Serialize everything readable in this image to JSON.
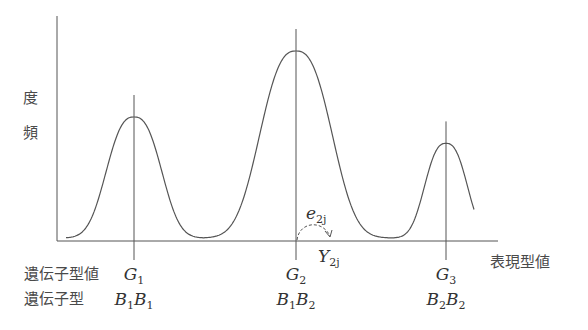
{
  "diagram": {
    "y_axis_label": "頻 度",
    "x_axis_label": "表現型値",
    "row_labels": {
      "genotypic_value": "遺伝子型値",
      "genotype": "遺伝子型"
    },
    "groups": [
      {
        "value_symbol": "G",
        "value_sub": "1",
        "genotype": [
          {
            "s": "B",
            "sub": "1"
          },
          {
            "s": "B",
            "sub": "1"
          }
        ],
        "relative_height": 0.55
      },
      {
        "value_symbol": "G",
        "value_sub": "2",
        "genotype": [
          {
            "s": "B",
            "sub": "1"
          },
          {
            "s": "B",
            "sub": "2"
          }
        ],
        "relative_height": 0.85
      },
      {
        "value_symbol": "G",
        "value_sub": "3",
        "genotype": [
          {
            "s": "B",
            "sub": "2"
          },
          {
            "s": "B",
            "sub": "2"
          }
        ],
        "relative_height": 0.43
      }
    ],
    "deviation_label": {
      "symbol": "e",
      "sub": "2j"
    },
    "phenotype_label": {
      "symbol": "Y",
      "sub": "2j"
    }
  }
}
